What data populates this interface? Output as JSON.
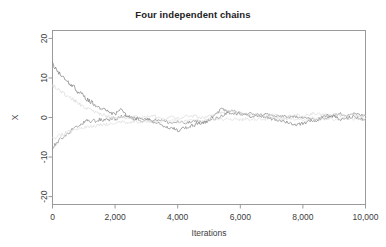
{
  "chart_data": {
    "type": "line",
    "title": "Four independent chains",
    "xlabel": "Iterations",
    "ylabel": "X",
    "xlim": [
      0,
      10000
    ],
    "ylim": [
      -22,
      22
    ],
    "grid": false,
    "legend": false,
    "xticks": [
      0,
      2000,
      4000,
      6000,
      8000,
      10000
    ],
    "xtick_labels": [
      "0",
      "2,000",
      "4,000",
      "6,000",
      "8,000",
      "10,000"
    ],
    "yticks": [
      -20,
      -10,
      0,
      10,
      20
    ],
    "ytick_labels": [
      "-20",
      "-10",
      "0",
      "10",
      "20"
    ],
    "colors": {
      "chain1": "#7d7d7d",
      "chain2": "#8a8a8a",
      "chain3": "#d9d9d9",
      "chain4": "#dedede",
      "axis": "#9a9a9a",
      "text": "#3c3c3c",
      "background": "#ffffff"
    },
    "series": [
      {
        "name": "chain 1",
        "color": "#7d7d7d",
        "start_value": 13.4,
        "x": [
          0,
          100,
          200,
          300,
          400,
          500,
          600,
          700,
          800,
          900,
          1000,
          1100,
          1200,
          1300,
          1400,
          1500,
          1600,
          1700,
          1800,
          1900,
          2000,
          2100,
          2200,
          2300,
          2400,
          2500,
          2600,
          2700,
          2800,
          2900,
          3000,
          3200,
          3400,
          3600,
          3800,
          4000,
          4200,
          4400,
          4600,
          4800,
          5000,
          5200,
          5400,
          5600,
          5800,
          6000,
          6200,
          6400,
          6600,
          6800,
          7000,
          7200,
          7400,
          7600,
          7800,
          8000,
          8200,
          8400,
          8600,
          8800,
          9000,
          9200,
          9400,
          9600,
          9800,
          10000
        ],
        "y": [
          13.4,
          12.2,
          11.4,
          10.6,
          9.9,
          9.0,
          8.1,
          7.6,
          6.6,
          6.1,
          5.4,
          4.6,
          4.1,
          3.6,
          3.0,
          2.5,
          2.1,
          1.9,
          1.5,
          1.1,
          0.8,
          1.6,
          2.0,
          1.2,
          0.4,
          0.2,
          -0.1,
          -0.4,
          -0.3,
          -0.6,
          -0.4,
          -1.0,
          -1.5,
          -2.2,
          -2.9,
          -3.2,
          -2.6,
          -2.2,
          -1.7,
          -1.3,
          -0.6,
          0.6,
          2.1,
          1.4,
          1.0,
          0.9,
          0.5,
          0.3,
          0.6,
          0.1,
          -0.3,
          -0.6,
          -0.9,
          -1.4,
          -1.8,
          -1.5,
          -1.0,
          -1.2,
          0.3,
          0.6,
          0.2,
          -0.4,
          -0.2,
          0.2,
          -0.3,
          -0.5
        ]
      },
      {
        "name": "chain 2",
        "color": "#8a8a8a",
        "start_value": -7.8,
        "x": [
          0,
          100,
          200,
          300,
          400,
          500,
          600,
          700,
          800,
          900,
          1000,
          1100,
          1200,
          1300,
          1400,
          1500,
          1600,
          1700,
          1800,
          1900,
          2000,
          2100,
          2200,
          2300,
          2400,
          2500,
          2600,
          2700,
          2800,
          2900,
          3000,
          3200,
          3400,
          3600,
          3800,
          4000,
          4200,
          4400,
          4600,
          4800,
          5000,
          5200,
          5400,
          5600,
          5800,
          6000,
          6200,
          6400,
          6600,
          6800,
          7000,
          7200,
          7400,
          7600,
          7800,
          8000,
          8200,
          8400,
          8600,
          8800,
          9000,
          9200,
          9400,
          9600,
          9800,
          10000
        ],
        "y": [
          -7.8,
          -6.8,
          -6.0,
          -5.2,
          -4.6,
          -4.0,
          -3.3,
          -2.7,
          -2.4,
          -1.9,
          -1.3,
          -0.8,
          -1.2,
          -0.6,
          -1.0,
          -0.5,
          -0.8,
          -0.3,
          -0.6,
          -0.2,
          -0.5,
          -0.1,
          0.2,
          0.5,
          0.3,
          -0.2,
          -0.5,
          -0.1,
          -0.6,
          -0.9,
          -0.4,
          -0.8,
          -0.5,
          -1.0,
          -1.4,
          -1.1,
          -1.5,
          -1.2,
          -0.9,
          -1.3,
          -0.8,
          -0.4,
          0.4,
          1.3,
          1.6,
          1.2,
          0.8,
          1.0,
          0.6,
          0.9,
          0.5,
          0.2,
          0.4,
          -0.1,
          0.3,
          0.1,
          -0.3,
          -0.7,
          -0.4,
          0.1,
          0.5,
          0.9,
          0.6,
          1.0,
          0.7,
          0.3
        ]
      },
      {
        "name": "chain 3",
        "color": "#d9d9d9",
        "start_value": 8.2,
        "x": [
          0,
          100,
          200,
          300,
          400,
          500,
          600,
          700,
          800,
          900,
          1000,
          1100,
          1200,
          1300,
          1400,
          1500,
          1600,
          1700,
          1800,
          1900,
          2000,
          2100,
          2200,
          2300,
          2400,
          2500,
          2600,
          2700,
          2800,
          2900,
          3000,
          3200,
          3400,
          3600,
          3800,
          4000,
          4200,
          4400,
          4600,
          4800,
          5000,
          5200,
          5400,
          5600,
          5800,
          6000,
          6200,
          6400,
          6600,
          6800,
          7000,
          7200,
          7400,
          7600,
          7800,
          8000,
          8200,
          8400,
          8600,
          8800,
          9000,
          9200,
          9400,
          9600,
          9800,
          10000
        ],
        "y": [
          8.2,
          7.6,
          7.0,
          6.5,
          5.9,
          5.3,
          4.8,
          4.2,
          3.7,
          3.2,
          2.7,
          2.3,
          1.9,
          1.5,
          1.2,
          0.9,
          0.6,
          0.4,
          0.2,
          0.0,
          -0.2,
          0.1,
          0.3,
          0.0,
          -0.3,
          -0.1,
          0.2,
          0.4,
          0.1,
          -0.2,
          0.1,
          0.3,
          0.0,
          -0.3,
          0.1,
          -0.2,
          0.2,
          0.5,
          0.2,
          -0.1,
          0.3,
          0.8,
          1.4,
          1.9,
          1.5,
          1.1,
          0.7,
          0.9,
          0.5,
          0.2,
          0.6,
          0.3,
          0.0,
          0.4,
          0.7,
          0.3,
          0.8,
          1.1,
          0.7,
          0.4,
          0.8,
          0.5,
          0.9,
          0.6,
          0.2,
          0.5
        ]
      },
      {
        "name": "chain 4",
        "color": "#dedede",
        "start_value": -5.4,
        "x": [
          0,
          100,
          200,
          300,
          400,
          500,
          600,
          700,
          800,
          900,
          1000,
          1100,
          1200,
          1300,
          1400,
          1500,
          1600,
          1700,
          1800,
          1900,
          2000,
          2100,
          2200,
          2300,
          2400,
          2500,
          2600,
          2700,
          2800,
          2900,
          3000,
          3200,
          3400,
          3600,
          3800,
          4000,
          4200,
          4400,
          4600,
          4800,
          5000,
          5200,
          5400,
          5600,
          5800,
          6000,
          6200,
          6400,
          6600,
          6800,
          7000,
          7200,
          7400,
          7600,
          7800,
          8000,
          8200,
          8400,
          8600,
          8800,
          9000,
          9200,
          9400,
          9600,
          9800,
          10000
        ],
        "y": [
          -5.4,
          -5.0,
          -4.6,
          -4.3,
          -4.0,
          -3.7,
          -3.4,
          -3.2,
          -3.0,
          -2.8,
          -2.6,
          -2.5,
          -2.3,
          -2.2,
          -2.1,
          -2.0,
          -1.9,
          -1.8,
          -1.7,
          -1.6,
          -1.5,
          -1.3,
          -1.1,
          -1.2,
          -1.4,
          -1.2,
          -1.0,
          -1.1,
          -1.3,
          -1.1,
          -0.9,
          -1.0,
          -1.2,
          -0.9,
          -0.7,
          -0.9,
          -1.1,
          -0.8,
          -0.6,
          -0.8,
          -0.5,
          -0.3,
          -0.5,
          -0.2,
          -0.4,
          -0.6,
          -0.3,
          -0.5,
          -0.2,
          -0.4,
          -0.1,
          -0.3,
          -0.5,
          -0.2,
          -0.4,
          -0.6,
          -0.3,
          -0.1,
          -0.4,
          -0.2,
          -0.5,
          -0.3,
          -0.1,
          -0.4,
          -0.2,
          -0.3
        ]
      }
    ]
  }
}
